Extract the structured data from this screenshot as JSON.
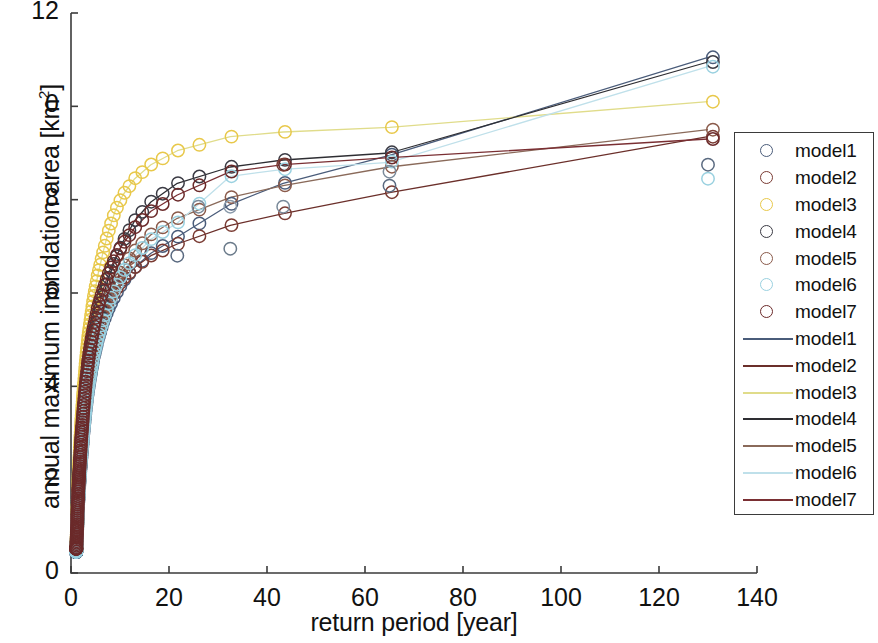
{
  "chart_data": {
    "type": "scatter",
    "title": "",
    "xlabel": "return period [year]",
    "ylabel": "annual maximum inundation area [km²]",
    "xlim": [
      0,
      140
    ],
    "ylim": [
      0,
      12
    ],
    "xticks": [
      0,
      20,
      40,
      60,
      80,
      100,
      120,
      140
    ],
    "yticks": [
      0,
      2,
      4,
      6,
      8,
      10,
      12
    ],
    "ytick_labels": [
      "0",
      "2",
      "4",
      "6",
      "8",
      "0",
      "12"
    ],
    "xtick_labels": [
      "0",
      "20",
      "40",
      "60",
      "80",
      "100",
      "120",
      "140"
    ],
    "grid": false,
    "legend_position": "right-outside",
    "marker": "circle-open",
    "note_ytick_10": "Rendered as '0' in the source screenshot (leading 1 clipped)",
    "series": [
      {
        "name": "model1",
        "marker_color": "#4a5c7a",
        "line_color": "#4a5c7a",
        "x": [
          1.1,
          1.3,
          1.5,
          1.8,
          2.1,
          2.5,
          2.9,
          3.4,
          4.0,
          4.7,
          5.5,
          6.5,
          7.6,
          9.0,
          10.6,
          13.0,
          16.3,
          21.7,
          32.5,
          43.3,
          65.0,
          130.0
        ],
        "y": [
          0.45,
          1.05,
          1.55,
          2.05,
          2.45,
          2.95,
          3.4,
          3.85,
          4.25,
          4.65,
          5.0,
          5.35,
          5.65,
          5.95,
          6.25,
          6.55,
          6.85,
          7.2,
          7.9,
          8.35,
          8.95,
          11.05
        ]
      },
      {
        "name": "model2",
        "marker_color": "#7a3b33",
        "line_color": "#6b2f2a",
        "x": [
          1.1,
          1.3,
          1.5,
          1.8,
          2.1,
          2.5,
          2.9,
          3.4,
          4.0,
          4.7,
          5.5,
          6.5,
          7.6,
          9.0,
          10.6,
          13.0,
          16.3,
          21.7,
          32.5,
          43.3,
          65.0,
          130.0
        ],
        "y": [
          0.5,
          1.1,
          1.65,
          2.2,
          2.7,
          3.2,
          3.65,
          4.1,
          4.5,
          4.85,
          5.2,
          5.5,
          5.8,
          6.05,
          6.3,
          6.55,
          6.8,
          7.05,
          7.45,
          7.7,
          8.15,
          9.35
        ]
      },
      {
        "name": "model3",
        "marker_color": "#e8c84a",
        "line_color": "#e0dc8a",
        "x": [
          1.1,
          1.3,
          1.5,
          1.8,
          2.1,
          2.5,
          2.9,
          3.4,
          4.0,
          4.7,
          5.5,
          6.5,
          7.6,
          9.0,
          10.6,
          13.0,
          16.3,
          21.7,
          32.5,
          43.3,
          65.0,
          130.0
        ],
        "y": [
          0.55,
          1.25,
          1.95,
          2.65,
          3.25,
          3.85,
          4.4,
          4.95,
          5.45,
          5.95,
          6.4,
          6.85,
          7.3,
          7.75,
          8.1,
          8.45,
          8.75,
          9.05,
          9.35,
          9.45,
          9.55,
          10.1
        ]
      },
      {
        "name": "model4",
        "marker_color": "#3b3b44",
        "line_color": "#2e2e33",
        "x": [
          1.1,
          1.3,
          1.5,
          1.8,
          2.1,
          2.5,
          2.9,
          3.4,
          4.0,
          4.7,
          5.5,
          6.5,
          7.6,
          9.0,
          10.6,
          13.0,
          16.3,
          21.7,
          32.5,
          43.3,
          65.0,
          130.0
        ],
        "y": [
          0.48,
          1.12,
          1.7,
          2.25,
          2.8,
          3.3,
          3.8,
          4.25,
          4.7,
          5.1,
          5.5,
          5.9,
          6.3,
          6.7,
          7.1,
          7.55,
          7.95,
          8.35,
          8.7,
          8.85,
          9.0,
          10.95
        ]
      },
      {
        "name": "model5",
        "marker_color": "#8a5a4a",
        "line_color": "#8a6a5a",
        "x": [
          1.1,
          1.3,
          1.5,
          1.8,
          2.1,
          2.5,
          2.9,
          3.4,
          4.0,
          4.7,
          5.5,
          6.5,
          7.6,
          9.0,
          10.6,
          13.0,
          16.3,
          21.7,
          32.5,
          43.3,
          65.0,
          130.0
        ],
        "y": [
          0.47,
          1.08,
          1.6,
          2.15,
          2.6,
          3.1,
          3.55,
          4.0,
          4.4,
          4.8,
          5.15,
          5.5,
          5.85,
          6.2,
          6.55,
          6.9,
          7.25,
          7.6,
          8.05,
          8.3,
          8.7,
          9.5
        ]
      },
      {
        "name": "model6",
        "marker_color": "#9ad1e0",
        "line_color": "#bfe0ea",
        "x": [
          1.1,
          1.3,
          1.5,
          1.8,
          2.1,
          2.5,
          2.9,
          3.4,
          4.0,
          4.7,
          5.5,
          6.5,
          7.6,
          9.0,
          10.6,
          13.0,
          16.3,
          21.7,
          32.5,
          43.3,
          65.0,
          130.0
        ],
        "y": [
          0.46,
          1.06,
          1.58,
          2.1,
          2.55,
          3.0,
          3.45,
          3.9,
          4.3,
          4.7,
          5.05,
          5.4,
          5.75,
          6.1,
          6.45,
          6.8,
          7.15,
          7.5,
          8.5,
          8.65,
          8.8,
          10.85
        ]
      },
      {
        "name": "model7",
        "marker_color": "#6b2a2a",
        "line_color": "#7a2f33",
        "x": [
          1.1,
          1.3,
          1.5,
          1.8,
          2.1,
          2.5,
          2.9,
          3.4,
          4.0,
          4.7,
          5.5,
          6.5,
          7.6,
          9.0,
          10.6,
          13.0,
          16.3,
          21.7,
          32.5,
          43.3,
          65.0,
          130.0
        ],
        "y": [
          0.52,
          1.18,
          1.78,
          2.35,
          2.9,
          3.45,
          3.95,
          4.45,
          4.9,
          5.3,
          5.7,
          6.05,
          6.4,
          6.75,
          7.05,
          7.4,
          7.75,
          8.1,
          8.6,
          8.75,
          8.9,
          9.3
        ]
      }
    ],
    "extra_scatter_clusters": [
      {
        "x": 21.7,
        "y": 6.8,
        "color": "#5a6a80"
      },
      {
        "x": 26.0,
        "y": 7.85,
        "color": "#7a8a9a"
      },
      {
        "x": 32.5,
        "y": 6.95,
        "color": "#6a7a8a"
      },
      {
        "x": 32.5,
        "y": 7.85,
        "color": "#8a9aaa"
      },
      {
        "x": 43.3,
        "y": 7.85,
        "color": "#7a8a9a"
      },
      {
        "x": 43.3,
        "y": 8.75,
        "color": "#7a3b33"
      },
      {
        "x": 65.0,
        "y": 8.3,
        "color": "#5a6a80"
      },
      {
        "x": 65.0,
        "y": 8.6,
        "color": "#7a8a9a"
      },
      {
        "x": 130.0,
        "y": 8.45,
        "color": "#9ad1e0"
      },
      {
        "x": 130.0,
        "y": 8.75,
        "color": "#5a6a80"
      }
    ]
  },
  "legend": {
    "entries": [
      {
        "label": "model1",
        "kind": "marker",
        "color": "#4a5c7a"
      },
      {
        "label": "model2",
        "kind": "marker",
        "color": "#7a3b33"
      },
      {
        "label": "model3",
        "kind": "marker",
        "color": "#e8c84a"
      },
      {
        "label": "model4",
        "kind": "marker",
        "color": "#3b3b44"
      },
      {
        "label": "model5",
        "kind": "marker",
        "color": "#8a5a4a"
      },
      {
        "label": "model6",
        "kind": "marker",
        "color": "#9ad1e0"
      },
      {
        "label": "model7",
        "kind": "marker",
        "color": "#6b2a2a"
      },
      {
        "label": "model1",
        "kind": "line",
        "color": "#4a5c7a"
      },
      {
        "label": "model2",
        "kind": "line",
        "color": "#6b2f2a"
      },
      {
        "label": "model3",
        "kind": "line",
        "color": "#e0dc8a"
      },
      {
        "label": "model4",
        "kind": "line",
        "color": "#2e2e33"
      },
      {
        "label": "model5",
        "kind": "line",
        "color": "#8a6a5a"
      },
      {
        "label": "model6",
        "kind": "line",
        "color": "#bfe0ea"
      },
      {
        "label": "model7",
        "kind": "line",
        "color": "#7a2f33"
      }
    ]
  },
  "axis": {
    "color": "#3b3b3b"
  }
}
